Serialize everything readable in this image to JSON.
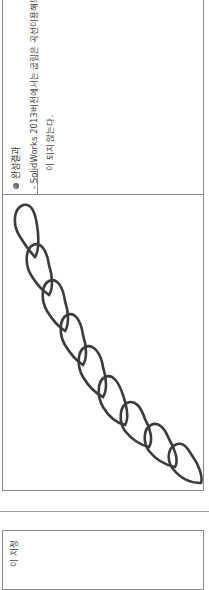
{
  "section": {
    "heading": "완성결과",
    "bullet_icon": "filled-circle-bullet",
    "note_line1": "- SolidWorks 2013버전에서는 굽힘은 곡선이용해도",
    "note_line2": "이 되지 않는다."
  },
  "figure": {
    "link_count": 9,
    "stroke_color": "#3c3c3c"
  },
  "lower_box": {
    "text": "이 지정"
  },
  "colors": {
    "border": "#8a8a8a",
    "text": "#444444",
    "background": "#ffffff"
  }
}
